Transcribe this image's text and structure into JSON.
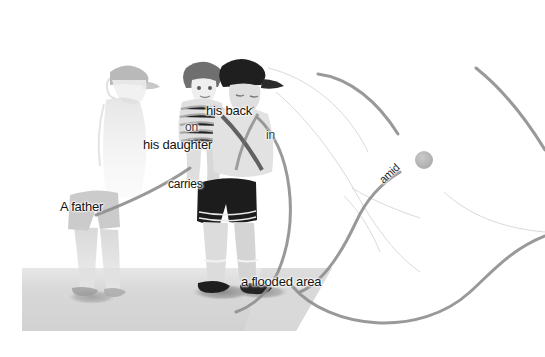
{
  "image": {
    "title": "Image captioning scene graph overlay",
    "alt": "Photograph of a man wearing a cap carrying a child on his back, walking through shallow flood water, with caption words overlaid and joined by curved arcs"
  },
  "caption": {
    "full_text": "A father carries his daughter on his back in a flooded area amid",
    "words": [
      {
        "id": "a-father",
        "label": "A father",
        "x": 60,
        "y": 200,
        "rotation": 0
      },
      {
        "id": "carries",
        "label": "carries",
        "x": 168,
        "y": 178,
        "rotation": 0
      },
      {
        "id": "his-daughter",
        "label": "his daughter",
        "x": 143,
        "y": 138,
        "rotation": 0
      },
      {
        "id": "on",
        "label": "on",
        "x": 185,
        "y": 121,
        "rotation": 0
      },
      {
        "id": "his-back",
        "label": "his back",
        "x": 206,
        "y": 104,
        "rotation": 0
      },
      {
        "id": "in",
        "label": "in",
        "x": 266,
        "y": 129,
        "rotation": 0
      },
      {
        "id": "flooded-area",
        "label": "a flooded area",
        "x": 241,
        "y": 275,
        "rotation": 0
      },
      {
        "id": "amid",
        "label": "amid",
        "x": 381,
        "y": 176,
        "rotation": -43
      }
    ]
  },
  "colors": {
    "background": "#ffffff",
    "text": "#141414",
    "thick_arc": "#8f8f8f",
    "thin_arc": "#d8d8d8",
    "node_fill": "#b8b8b8",
    "ground": "#d2d2d2",
    "shadow": "#8a8a8a",
    "figure_dark": "#2e2e2e",
    "figure_mid": "#9a9a9a",
    "figure_light": "#e8e8e8"
  },
  "graph": {
    "node_count": 1,
    "node_label": "attention-node",
    "arc_count": 5
  },
  "figures": [
    {
      "id": "ghost-figure",
      "label": "faded man with cap",
      "opacity": "low"
    },
    {
      "id": "child-figure",
      "label": "child on back",
      "opacity": "medium"
    },
    {
      "id": "father-figure",
      "label": "man with dark cap",
      "opacity": "high"
    }
  ]
}
